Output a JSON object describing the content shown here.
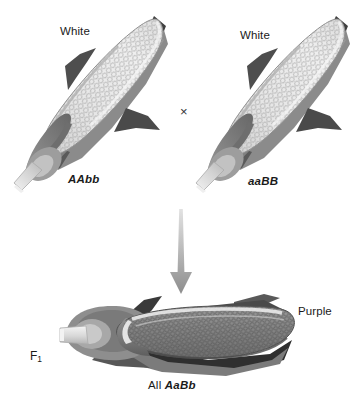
{
  "figure": {
    "background_color": "#ffffff",
    "width": 362,
    "height": 404
  },
  "parents": [
    {
      "id": "parent-left",
      "phenotype_label": "White",
      "genotype_label": "AAbb",
      "kernel_color": "#dedede",
      "husk_dark_color": "#4a4a4a",
      "husk_mid_color": "#8c8c8c",
      "stem_color": "#d8d8d8",
      "orientation": "diagonal"
    },
    {
      "id": "parent-right",
      "phenotype_label": "White",
      "genotype_label": "aaBB",
      "kernel_color": "#dedede",
      "husk_dark_color": "#4a4a4a",
      "husk_mid_color": "#8c8c8c",
      "stem_color": "#d8d8d8",
      "orientation": "diagonal"
    }
  ],
  "cross": {
    "symbol": "×",
    "arrow_name": "down-arrow"
  },
  "offspring": {
    "id": "f1-cob",
    "generation_label_text": "F",
    "generation_label_sub": "1",
    "phenotype_label": "Purple",
    "genotype_prefix": "All ",
    "genotype_label": "AaBb",
    "kernel_color": "#8a8a8a",
    "husk_dark_color": "#3c3c3c",
    "husk_mid_color": "#808080",
    "stem_color": "#d8d8d8",
    "orientation": "horizontal"
  },
  "colors": {
    "text": "#1a1a1a",
    "arrow_light": "#d5d5d5",
    "arrow_dark": "#8f8f8f",
    "kernel_light": "#dedede",
    "kernel_dark": "#8a8a8a",
    "husk_dark": "#454545",
    "husk_mid": "#8c8c8c",
    "outline": "#2b2b2b"
  }
}
